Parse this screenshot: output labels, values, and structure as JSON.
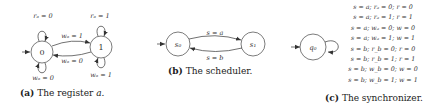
{
  "figures": {
    "register": {
      "caption_tag": "(a)",
      "caption_text": "The register ",
      "caption_var": "a.",
      "states": [
        {
          "id": "0",
          "label": "0",
          "initial": true
        },
        {
          "id": "1",
          "label": "1",
          "initial": false
        }
      ],
      "transitions": [
        {
          "from": "0",
          "to": "0",
          "label": "r_a = 0",
          "display": "rₐ = 0",
          "position": "loop-top"
        },
        {
          "from": "1",
          "to": "1",
          "label": "r_a = 1",
          "display": "rₐ = 1",
          "position": "loop-top"
        },
        {
          "from": "0",
          "to": "1",
          "label": "w_a = 1",
          "display": "wₐ = 1",
          "position": "upper"
        },
        {
          "from": "1",
          "to": "0",
          "label": "w_a = 0",
          "display": "wₐ = 0",
          "position": "lower"
        },
        {
          "from": "0",
          "to": "0",
          "label": "w_a = 0",
          "display": "wₐ = 0",
          "position": "loop-bottom"
        },
        {
          "from": "1",
          "to": "1",
          "label": "w_a = 1",
          "display": "wₐ = 1",
          "position": "loop-bottom"
        }
      ]
    },
    "scheduler": {
      "caption_tag": "(b)",
      "caption_text": "The scheduler.",
      "states": [
        {
          "id": "s0",
          "label": "s₀",
          "initial": true
        },
        {
          "id": "s1",
          "label": "s₁",
          "initial": false
        }
      ],
      "transitions": [
        {
          "from": "s0",
          "to": "s1",
          "label": "s = a",
          "display": "s = a"
        },
        {
          "from": "s1",
          "to": "s0",
          "label": "s = b",
          "display": "s = b"
        }
      ]
    },
    "synchronizer": {
      "caption_tag": "(c)",
      "caption_text": "The synchronizer.",
      "states": [
        {
          "id": "q0",
          "label": "q₀",
          "initial": true
        }
      ],
      "self_loop_labels": [
        "s = a; rₐ = 0; r = 0",
        "s = a; rₐ = 1; r = 1",
        "s = a; wₐ = 0; w = 0",
        "s = a; wₐ = 1; w = 1",
        "s = b; r_b = 0; r = 0",
        "s = b; r_b = 1; r = 1",
        "s = b; w_b = 0; w = 0",
        "s = b; w_b = 1; w = 1"
      ]
    }
  }
}
